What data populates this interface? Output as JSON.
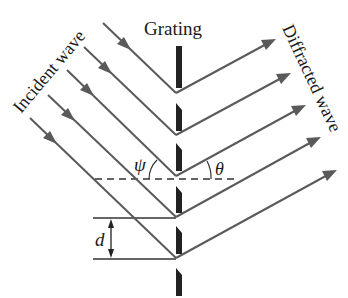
{
  "diagram": {
    "labels": {
      "grating": "Grating",
      "incident_wave": "Incident wave",
      "diffracted_wave": "Diffracted wave",
      "incidence_angle": "ψ",
      "diffraction_angle": "θ",
      "slit_spacing": "d"
    },
    "colors": {
      "ray": "#5a5a5a",
      "grating": "#222222",
      "reference_lines": "#333333",
      "background": "#ffffff"
    },
    "grating": {
      "x": 176,
      "segments": [
        {
          "y1": 46,
          "y2": 88
        },
        {
          "y1": 103,
          "y2": 131
        },
        {
          "y1": 143,
          "y2": 171
        },
        {
          "y1": 186,
          "y2": 213
        },
        {
          "y1": 226,
          "y2": 254
        },
        {
          "y1": 268,
          "y2": 296
        }
      ]
    },
    "incident_rays": [
      {
        "x1": 103,
        "y1": 23,
        "x2": 176,
        "y2": 93
      },
      {
        "x1": 84,
        "y1": 47,
        "x2": 176,
        "y2": 135
      },
      {
        "x1": 67,
        "y1": 70,
        "x2": 176,
        "y2": 176
      },
      {
        "x1": 48,
        "y1": 95,
        "x2": 176,
        "y2": 217
      },
      {
        "x1": 30,
        "y1": 118,
        "x2": 176,
        "y2": 258
      }
    ],
    "diffracted_rays": [
      {
        "x1": 176,
        "y1": 93,
        "x2": 275,
        "y2": 39
      },
      {
        "x1": 176,
        "y1": 135,
        "x2": 290,
        "y2": 73
      },
      {
        "x1": 176,
        "y1": 176,
        "x2": 305,
        "y2": 105
      },
      {
        "x1": 176,
        "y1": 217,
        "x2": 320,
        "y2": 137
      },
      {
        "x1": 176,
        "y1": 258,
        "x2": 336,
        "y2": 170
      }
    ],
    "normal_line": {
      "x1": 95,
      "x2": 236,
      "y": 179
    },
    "spacing_lines": [
      {
        "x1": 93,
        "x2": 176,
        "y": 218
      },
      {
        "x1": 93,
        "x2": 176,
        "y": 259
      }
    ]
  }
}
